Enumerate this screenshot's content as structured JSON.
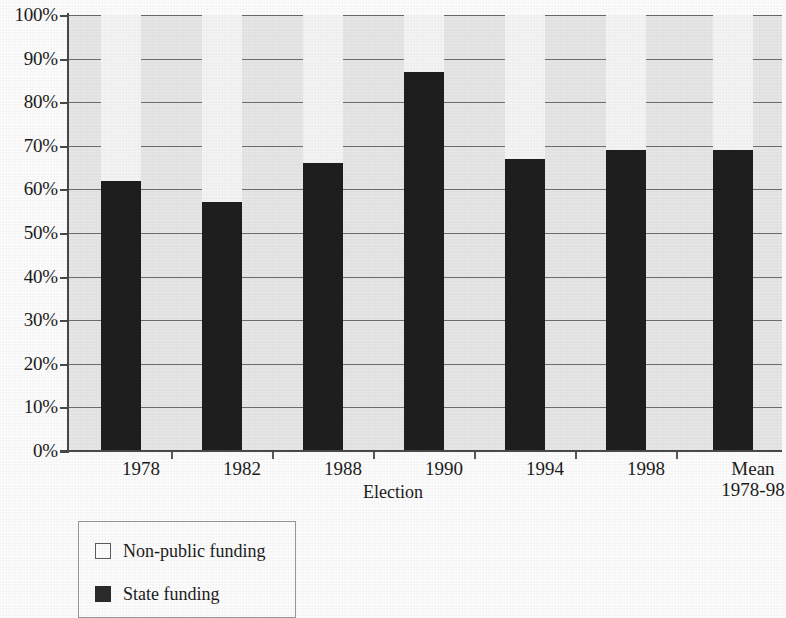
{
  "chart_data": {
    "type": "bar",
    "subtype": "stacked-100-percent",
    "title": "",
    "xlabel": "Election",
    "ylabel": "",
    "categories": [
      "1978",
      "1982",
      "1988",
      "1990",
      "1994",
      "1998",
      "Mean\n1978-98"
    ],
    "category_labels_flat": [
      "1978",
      "1982",
      "1988",
      "1990",
      "1994",
      "1998",
      "Mean 1978-98"
    ],
    "series": [
      {
        "name": "State funding",
        "color": "#201f1f",
        "values": [
          62,
          57,
          66,
          87,
          67,
          69,
          69
        ]
      },
      {
        "name": "Non-public funding",
        "color": "#f7f7f7",
        "values": [
          38,
          43,
          34,
          13,
          33,
          31,
          31
        ]
      }
    ],
    "ylim": [
      0,
      100
    ],
    "ytick_values": [
      0,
      10,
      20,
      30,
      40,
      50,
      60,
      70,
      80,
      90,
      100
    ],
    "ytick_labels": [
      "0%",
      "10%",
      "20%",
      "30%",
      "40%",
      "50%",
      "60%",
      "70%",
      "80%",
      "90%",
      "100%"
    ],
    "grid": true,
    "grid_axis": "y",
    "legend_position": "below-left",
    "plot_background": "#e9e9e9",
    "gridline_color": "#6f6f6f",
    "axis_color": "#4a4a4a"
  },
  "legend": {
    "entries": [
      {
        "label": "Non-public funding",
        "swatch": "white-square-outline"
      },
      {
        "label": "State funding",
        "swatch": "black-square-filled"
      }
    ]
  },
  "axis": {
    "x_title": "Election"
  }
}
